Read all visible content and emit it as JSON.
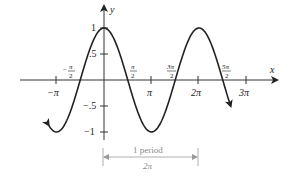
{
  "chart_data": {
    "type": "line",
    "title": "",
    "function": "y = cos x",
    "xlabel": "x",
    "ylabel": "y",
    "xlim": [
      -3.52,
      3.6
    ],
    "ylim": [
      -1.1,
      1.45
    ],
    "x_ticks": [
      {
        "value": -3.14159,
        "label": "−π",
        "position": "below"
      },
      {
        "value": -1.5708,
        "label_num": "π",
        "label_den": "2",
        "sign": "−",
        "position": "above"
      },
      {
        "value": 1.5708,
        "label_num": "π",
        "label_den": "2",
        "sign": "",
        "position": "above"
      },
      {
        "value": 3.14159,
        "label": "π",
        "position": "below"
      },
      {
        "value": 4.71239,
        "label_num": "3π",
        "label_den": "2",
        "sign": "",
        "position": "above"
      },
      {
        "value": 6.28318,
        "label": "2π",
        "position": "below"
      },
      {
        "value": 7.85398,
        "label_num": "5π",
        "label_den": "2",
        "sign": "",
        "position": "above"
      },
      {
        "value": 9.42478,
        "label": "3π",
        "position": "below"
      }
    ],
    "y_ticks": [
      {
        "value": 1,
        "label": "1"
      },
      {
        "value": 0.5,
        "label": ".5"
      },
      {
        "value": -0.5,
        "label": "−.5"
      },
      {
        "value": -1,
        "label": "−1"
      }
    ],
    "series": [
      {
        "name": "cos x",
        "x": [
          -3.66,
          -3.14159,
          -1.5708,
          0,
          1.5708,
          3.14159,
          4.71239,
          6.28318,
          7.85398,
          8.38
        ],
        "y": [
          -0.87,
          -1,
          0,
          1,
          0,
          -1,
          0,
          1,
          0,
          -0.5
        ]
      }
    ],
    "annotations": [
      {
        "text": "1 period",
        "sub": "2π",
        "from": 0,
        "to": 6.28318
      }
    ],
    "grid": false,
    "legend": null
  },
  "labels": {
    "x_axis": "x",
    "y_axis": "y",
    "neg_pi": "−π",
    "pi": "π",
    "two_pi": "2π",
    "three_pi": "3π",
    "pi_num": "π",
    "three_pi_num": "3π",
    "five_pi_num": "5π",
    "den_two": "2",
    "neg_sign": "−",
    "y_one": "1",
    "y_half": ".5",
    "y_neg_half": "−.5",
    "y_neg_one": "−1",
    "period_label": "1 period",
    "period_value": "2π"
  }
}
